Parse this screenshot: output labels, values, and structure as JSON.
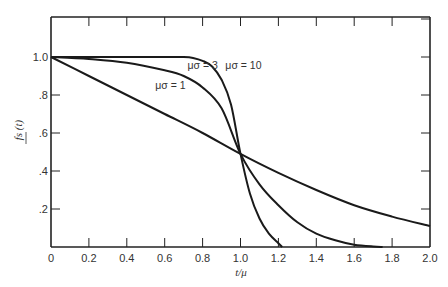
{
  "chart_data": {
    "type": "line",
    "title": "",
    "xlabel": "t/μ",
    "ylabel": "fs (t)",
    "xlim": [
      0,
      2.0
    ],
    "ylim": [
      0,
      1.2
    ],
    "grid": false,
    "x_ticks": [
      "0",
      "0.2",
      "0.4",
      "0.6",
      "0.8",
      "1.0",
      "1.2",
      "1.4",
      "1.6",
      "1.8",
      "2.0"
    ],
    "y_ticks": [
      ".2",
      ".4",
      ".6",
      ".8",
      "1.0"
    ],
    "series": [
      {
        "name": "μσ = 1",
        "label_pos": [
          0.55,
          0.83
        ],
        "x": [
          0,
          0.2,
          0.4,
          0.6,
          0.8,
          1.0,
          1.2,
          1.4,
          1.6,
          1.8,
          2.0
        ],
        "y": [
          1.0,
          0.9,
          0.8,
          0.7,
          0.6,
          0.49,
          0.39,
          0.3,
          0.22,
          0.16,
          0.11
        ]
      },
      {
        "name": "μσ = 3",
        "label_pos": [
          0.72,
          0.935
        ],
        "x": [
          0,
          0.2,
          0.4,
          0.6,
          0.7,
          0.8,
          0.9,
          1.0,
          1.1,
          1.2,
          1.3,
          1.4,
          1.5,
          1.6,
          1.7,
          1.75
        ],
        "y": [
          1.0,
          0.99,
          0.97,
          0.93,
          0.9,
          0.84,
          0.73,
          0.49,
          0.33,
          0.22,
          0.13,
          0.07,
          0.035,
          0.012,
          0.003,
          0.0
        ]
      },
      {
        "name": "μσ = 10",
        "label_pos": [
          0.92,
          0.935
        ],
        "x": [
          0,
          0.2,
          0.4,
          0.6,
          0.7,
          0.75,
          0.8,
          0.85,
          0.9,
          0.95,
          1.0,
          1.05,
          1.1,
          1.15,
          1.2,
          1.22
        ],
        "y": [
          1.0,
          1.0,
          1.0,
          1.0,
          1.0,
          0.995,
          0.98,
          0.95,
          0.88,
          0.75,
          0.49,
          0.28,
          0.15,
          0.07,
          0.02,
          0.0
        ]
      }
    ]
  }
}
